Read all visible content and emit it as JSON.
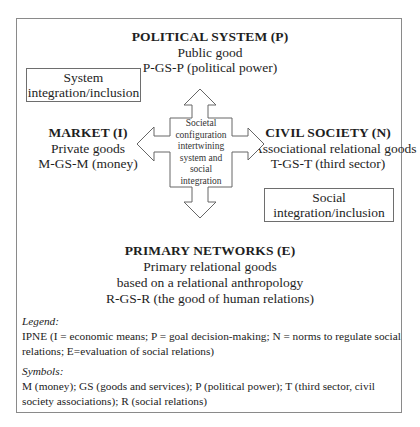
{
  "diagram": {
    "political_system": {
      "title": "POLITICAL SYSTEM (P)",
      "line1": "Public good",
      "line2": "P-GS-P (political power)"
    },
    "market": {
      "title": "MARKET (I)",
      "line1": "Private goods",
      "line2": "M-GS-M (money)"
    },
    "civil_society": {
      "title": "CIVIL SOCIETY (N)",
      "line1": "Associational relational goods",
      "line2": "T-GS-T (third sector)"
    },
    "primary_networks": {
      "title": "PRIMARY NETWORKS (E)",
      "line1": "Primary relational goods",
      "line2": "based on a relational anthropology",
      "line3": "R-GS-R (the good of human relations)"
    },
    "system_box": {
      "line1": "System",
      "line2": "integration/inclusion"
    },
    "social_box": {
      "line1": "Social",
      "line2": "integration/inclusion"
    },
    "center": {
      "line1": "Societal",
      "line2": "configuration",
      "line3": "intertwining",
      "line4": "system and",
      "line5": "social",
      "line6": "integration"
    },
    "arrows": [
      "up",
      "down",
      "left",
      "right"
    ]
  },
  "legend": {
    "label": "Legend:",
    "text": "IPNE (I = economic means; P = goal decision-making; N = norms to regulate social relations; E=evaluation of social relations)"
  },
  "symbols": {
    "label": "Symbols:",
    "text": "M (money); GS (goods and services); P (political power); T (third sector, civil society associations); R (social relations)"
  },
  "colors": {
    "frame": "#8a8a8a",
    "arrow_stroke": "#666666",
    "text": "#1e1e1e"
  }
}
